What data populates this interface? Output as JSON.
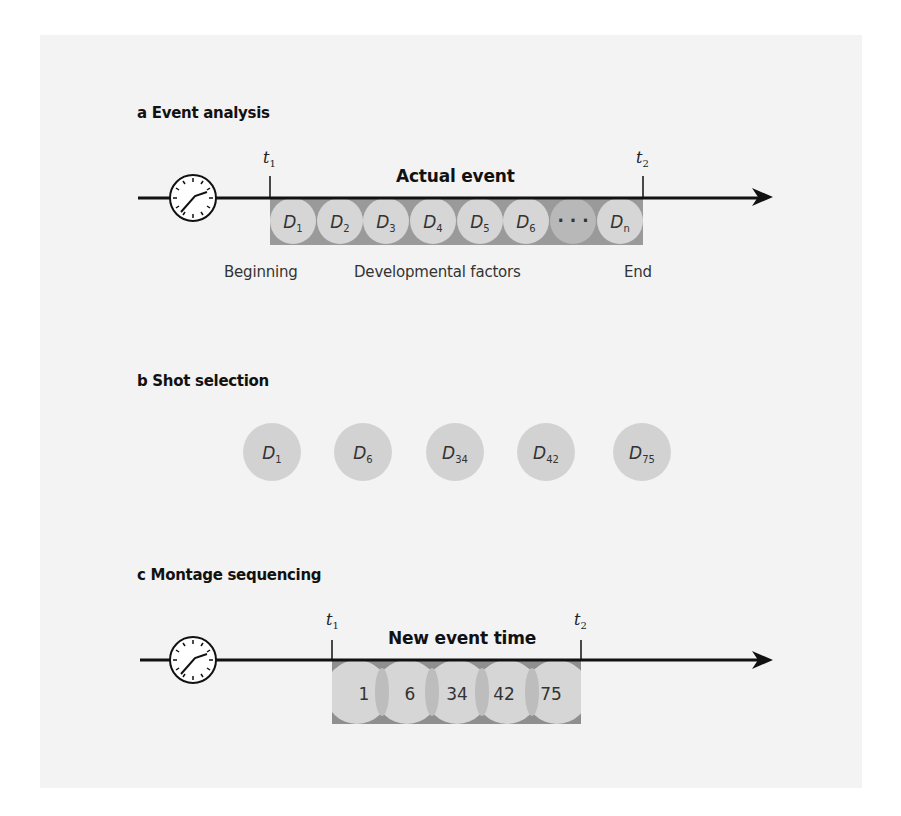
{
  "colors": {
    "panel_bg": "#f3f3f3",
    "band_dark": "#9a9a9a",
    "circle_light": "#d6d6d6",
    "circle_dark": "#b8b8b8",
    "overlap": "#c2c2c2",
    "line": "#111111"
  },
  "section_a": {
    "title": "a  Event analysis",
    "event_label": "Actual event",
    "t1": {
      "base": "t",
      "sub": "1"
    },
    "t2": {
      "base": "t",
      "sub": "2"
    },
    "clock_icon": "clock-icon",
    "factors": [
      {
        "base": "D",
        "sub": "1"
      },
      {
        "base": "D",
        "sub": "2"
      },
      {
        "base": "D",
        "sub": "3"
      },
      {
        "base": "D",
        "sub": "4"
      },
      {
        "base": "D",
        "sub": "5"
      },
      {
        "base": "D",
        "sub": "6"
      },
      {
        "base": "· · ·",
        "sub": ""
      },
      {
        "base": "D",
        "sub": "n"
      }
    ],
    "captions": {
      "beginning": "Beginning",
      "developmental": "Developmental factors",
      "end": "End"
    }
  },
  "section_b": {
    "title": "b Shot selection",
    "shots": [
      {
        "base": "D",
        "sub": "1"
      },
      {
        "base": "D",
        "sub": "6"
      },
      {
        "base": "D",
        "sub": "34"
      },
      {
        "base": "D",
        "sub": "42"
      },
      {
        "base": "D",
        "sub": "75"
      }
    ]
  },
  "section_c": {
    "title": "c  Montage sequencing",
    "event_label": "New event time",
    "t1": {
      "base": "t",
      "sub": "1"
    },
    "t2": {
      "base": "t",
      "sub": "2"
    },
    "clock_icon": "clock-icon",
    "sequence": [
      "1",
      "6",
      "34",
      "42",
      "75"
    ]
  }
}
